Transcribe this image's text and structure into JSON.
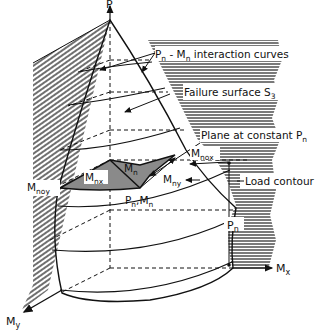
{
  "diagram": {
    "axes": {
      "p": "P",
      "mx": "M",
      "mx_sub": "x",
      "my": "M",
      "my_sub": "y"
    },
    "labels": {
      "interaction_curves": {
        "main1": "P",
        "sub1": "n",
        "mid": " - M",
        "sub2": "n",
        "rest": "  interaction curves"
      },
      "failure_surface": {
        "main": "Failure surface S",
        "sub": "3"
      },
      "plane": {
        "main": "Plane at constant P",
        "sub": "n"
      },
      "mnox": {
        "main": "M",
        "sub": "nox"
      },
      "mnoy": {
        "main": "M",
        "sub": "noy"
      },
      "mnx": {
        "main": "M",
        "sub": "nx"
      },
      "mn": {
        "main": "M",
        "sub": "n"
      },
      "mny": {
        "main": "M",
        "sub": "ny"
      },
      "pn_mn": {
        "a": "P",
        "a_sub": "n",
        "b": ",M",
        "b_sub": "n"
      },
      "load_contour": "Load contour",
      "pn_dim": {
        "main": "P",
        "sub": "n"
      }
    },
    "colors": {
      "ink": "#111111",
      "background": "#ffffff",
      "shade": "#9a9a9a"
    }
  }
}
